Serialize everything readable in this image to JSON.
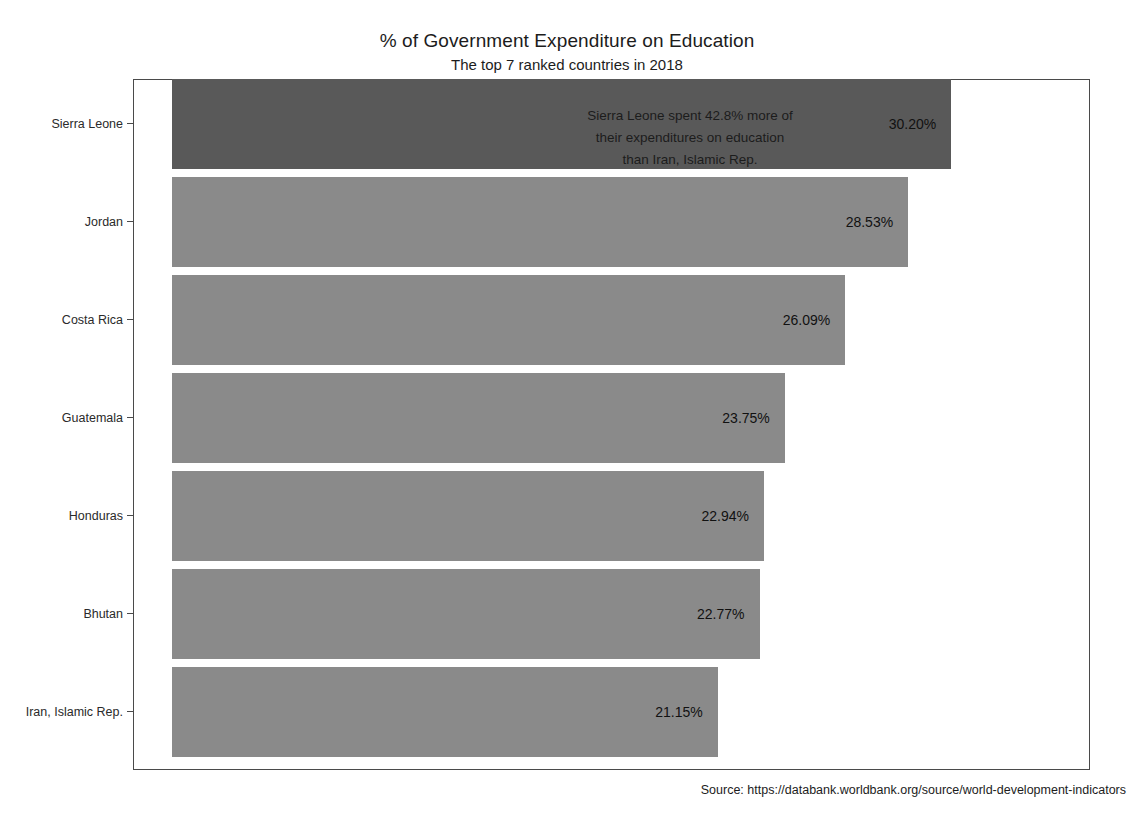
{
  "chart_data": {
    "type": "bar",
    "orientation": "horizontal",
    "title": "% of Government Expenditure on Education",
    "subtitle": "The top 7 ranked countries in 2018",
    "xlabel": "",
    "ylabel": "",
    "categories": [
      "Sierra Leone",
      "Jordan",
      "Costa Rica",
      "Guatemala",
      "Honduras",
      "Bhutan",
      "Iran, Islamic Rep."
    ],
    "values": [
      30.2,
      28.53,
      26.09,
      23.75,
      22.94,
      22.77,
      21.15
    ],
    "value_labels": [
      "30.20%",
      "28.53%",
      "26.09%",
      "23.75%",
      "22.94%",
      "22.77%",
      "21.15%"
    ],
    "xlim": [
      0,
      35.5
    ],
    "grid": false,
    "legend": null,
    "bar_color": "#8a8a8a",
    "highlight_color": "#595959",
    "highlight_index": 0,
    "annotations": [
      "Sierra Leone spent 42.8% more of",
      "their expenditures on education",
      "than Iran, Islamic Rep."
    ],
    "source": "Source:  https://databank.worldbank.org/source/world-development-indicators"
  }
}
